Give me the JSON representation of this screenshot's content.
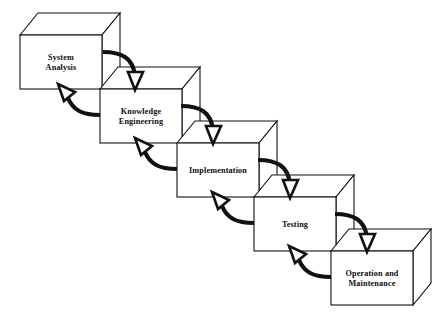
{
  "diagram": {
    "type": "process-flow-cascade",
    "background_color": "#ffffff",
    "line_color": "#111111",
    "stages": [
      {
        "id": "system-analysis",
        "label_lines": [
          "System",
          "Analysis"
        ],
        "order": 1,
        "front": {
          "x": 20,
          "y": 35,
          "w": 82,
          "h": 54
        },
        "depth": {
          "dx": 18,
          "dy": -22
        }
      },
      {
        "id": "knowledge-engineering",
        "label_lines": [
          "Knowledge",
          "Engineering"
        ],
        "order": 2,
        "front": {
          "x": 100,
          "y": 89,
          "w": 82,
          "h": 54
        },
        "depth": {
          "dx": 18,
          "dy": -22
        }
      },
      {
        "id": "implementation",
        "label_lines": [
          "Implementation"
        ],
        "order": 3,
        "front": {
          "x": 177,
          "y": 143,
          "w": 82,
          "h": 54
        },
        "depth": {
          "dx": 18,
          "dy": -22
        }
      },
      {
        "id": "testing",
        "label_lines": [
          "Testing"
        ],
        "order": 4,
        "front": {
          "x": 254,
          "y": 197,
          "w": 82,
          "h": 54
        },
        "depth": {
          "dx": 18,
          "dy": -22
        }
      },
      {
        "id": "operation-and-maintenance",
        "label_lines": [
          "Operation and",
          "Maintenance"
        ],
        "order": 5,
        "front": {
          "x": 331,
          "y": 251,
          "w": 82,
          "h": 54
        },
        "depth": {
          "dx": 18,
          "dy": -22
        }
      }
    ],
    "forward_arrows": [
      {
        "id": "forward-1",
        "from": "system-analysis",
        "to": "knowledge-engineering",
        "path": "M 103 52 C 122 52 133 58 135 76",
        "head": "M 128 72 L 143 72 L 135 90 Z"
      },
      {
        "id": "forward-2",
        "from": "knowledge-engineering",
        "to": "implementation",
        "path": "M 181 106 C 200 106 211 112 213 130",
        "head": "M 206 126 L 221 126 L 213 144 Z"
      },
      {
        "id": "forward-3",
        "from": "implementation",
        "to": "testing",
        "path": "M 258 160 C 277 160 288 166 290 184",
        "head": "M 283 180 L 298 180 L 290 198 Z"
      },
      {
        "id": "forward-4",
        "from": "testing",
        "to": "operation-and-maintenance",
        "path": "M 335 214 C 354 214 365 220 367 238",
        "head": "M 360 234 L 375 234 L 367 252 Z"
      }
    ],
    "feedback_arrows": [
      {
        "id": "feedback-1",
        "from": "knowledge-engineering",
        "to": "system-analysis",
        "path": "M 100 115 C 82 115 73 110 68 98",
        "head": "M 58 84 L 75 92 L 64 101 Z"
      },
      {
        "id": "feedback-2",
        "from": "implementation",
        "to": "knowledge-engineering",
        "path": "M 177 169 C 159 169 150 164 145 152",
        "head": "M 135 138 L 152 146 L 141 155 Z"
      },
      {
        "id": "feedback-3",
        "from": "testing",
        "to": "implementation",
        "path": "M 254 223 C 236 223 227 218 222 206",
        "head": "M 212 192 L 229 200 L 218 209 Z"
      },
      {
        "id": "feedback-4",
        "from": "operation-and-maintenance",
        "to": "testing",
        "path": "M 331 277 C 313 277 304 272 299 260",
        "head": "M 289 246 L 306 254 L 295 263 Z"
      }
    ]
  }
}
